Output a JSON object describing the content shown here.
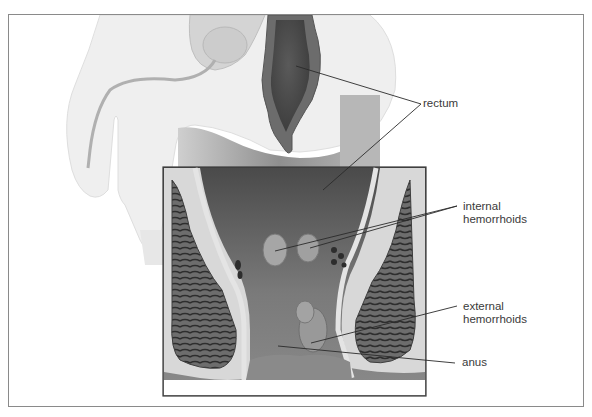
{
  "figure": {
    "labels": [
      {
        "id": "rectum",
        "lines": [
          "rectum"
        ]
      },
      {
        "id": "internal_hemorrhoids",
        "lines": [
          "internal",
          "hemorrhoids"
        ]
      },
      {
        "id": "external_hemorrhoids",
        "lines": [
          "external",
          "hemorrhoids"
        ]
      },
      {
        "id": "anus",
        "lines": [
          "anus"
        ]
      }
    ],
    "colors": {
      "frame": "#8a8a8a",
      "body_silhouette": "#efefef",
      "rectum_wall": "#6a6a6a",
      "rectum_lumen": "#4e4e4e",
      "inset_background": "#5f5f5f",
      "muscle": "#3c3c3c",
      "leader_line": "#2a2a2a",
      "label_text": "#3a3a3a"
    }
  }
}
